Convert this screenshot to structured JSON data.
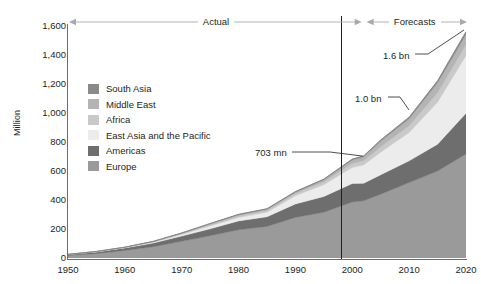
{
  "chart_data": {
    "type": "area",
    "title": "",
    "subtitle": "",
    "xlabel": "",
    "ylabel": "Million",
    "xlim": [
      1950,
      2020
    ],
    "ylim": [
      0,
      1600
    ],
    "ytick_values": [
      0,
      200,
      400,
      600,
      800,
      1000,
      1200,
      1400,
      1600
    ],
    "ytick_labels": [
      "0",
      "200",
      "400",
      "600",
      "800",
      "1,000",
      "1,200",
      "1,400",
      "1,600"
    ],
    "xtick_values": [
      1950,
      1960,
      1970,
      1980,
      1990,
      2000,
      2010,
      2020
    ],
    "xtick_labels": [
      "1950",
      "1960",
      "1970",
      "1980",
      "1990",
      "2000",
      "2010",
      "2020"
    ],
    "grid": false,
    "legend_position": "inside-upper-left",
    "stacked": true,
    "stack_order_bottom_to_top": [
      "Europe",
      "Americas",
      "East Asia and the Pacific",
      "Africa",
      "Middle East",
      "South Asia"
    ],
    "x": [
      1950,
      1955,
      1960,
      1965,
      1970,
      1975,
      1980,
      1985,
      1990,
      1995,
      2000,
      2002,
      2005,
      2010,
      2015,
      2020
    ],
    "series": [
      {
        "name": "Europe",
        "color": "#9a9a9a",
        "values": [
          17,
          30,
          51,
          78,
          115,
          154,
          194,
          218,
          280,
          315,
          386,
          394,
          440,
          520,
          600,
          717
        ]
      },
      {
        "name": "Americas",
        "color": "#6e6e6e",
        "values": [
          7,
          12,
          18,
          25,
          36,
          47,
          62,
          66,
          93,
          109,
          128,
          121,
          134,
          150,
          185,
          282
        ]
      },
      {
        "name": "East Asia and the Pacific",
        "color": "#ececec",
        "values": [
          0.2,
          1,
          3,
          6,
          11,
          19,
          23,
          31,
          56,
          82,
          110,
          126,
          156,
          195,
          290,
          397
        ]
      },
      {
        "name": "Africa",
        "color": "#c9c9c9",
        "values": [
          0.5,
          1,
          1,
          3,
          5,
          8,
          11,
          12,
          15,
          20,
          27,
          29,
          37,
          47,
          64,
          77
        ]
      },
      {
        "name": "Middle East",
        "color": "#b4b4b4",
        "values": [
          0.2,
          1,
          1,
          2,
          4,
          8,
          9,
          10,
          10,
          14,
          25,
          28,
          39,
          48,
          69,
          69
        ]
      },
      {
        "name": "South Asia",
        "color": "#8a8a8a",
        "values": [
          0.2,
          0.5,
          1,
          1,
          2,
          2,
          2,
          3,
          4,
          4,
          6,
          6,
          8,
          11,
          14,
          19
        ]
      }
    ],
    "annotations": [
      {
        "id": "total-2002",
        "label": "703 mn",
        "x": 2002,
        "y": 703
      },
      {
        "id": "total-2010",
        "label": "1.0 bn",
        "x": 2010,
        "y": 1000
      },
      {
        "id": "total-2020",
        "label": "1.6 bn",
        "x": 2020,
        "y": 1600
      }
    ],
    "period_bands": [
      {
        "label": "Actual",
        "from": 1950,
        "to": 2002
      },
      {
        "label": "Forecasts",
        "from": 2002,
        "to": 2020
      }
    ],
    "divider_x": 2002
  },
  "legend": {
    "items": [
      {
        "label": "South Asia",
        "color": "#8a8a8a"
      },
      {
        "label": "Middle East",
        "color": "#b4b4b4"
      },
      {
        "label": "Africa",
        "color": "#c9c9c9"
      },
      {
        "label": "East Asia and the Pacific",
        "color": "#ececec"
      },
      {
        "label": "Americas",
        "color": "#6e6e6e"
      },
      {
        "label": "Europe",
        "color": "#9a9a9a"
      }
    ]
  },
  "colors": {
    "axis": "#6d6e71",
    "divider": "#231f20",
    "text": "#231f20",
    "arrow": "#a7a9ac",
    "leader": "#231f20"
  }
}
